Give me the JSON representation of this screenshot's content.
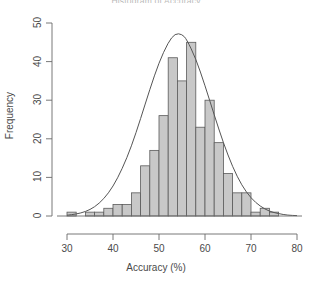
{
  "chart_data": {
    "type": "bar",
    "title": "Histogram of Accuracy",
    "xlabel": "Accuracy (%)",
    "ylabel": "Frequency",
    "xlim": [
      30,
      80
    ],
    "ylim": [
      0,
      50
    ],
    "xticks": [
      30,
      40,
      50,
      60,
      70,
      80
    ],
    "yticks": [
      0,
      10,
      20,
      30,
      40,
      50
    ],
    "grid": false,
    "legend": null,
    "bin_width": 2,
    "bar_fill_color": "#c8c8c8",
    "bar_edge_color": "#5a5a5a",
    "curve_color": "#555555",
    "curve_label": "normal density overlay",
    "bin_starts": [
      30,
      32,
      34,
      36,
      38,
      40,
      42,
      44,
      46,
      48,
      50,
      52,
      54,
      56,
      58,
      60,
      62,
      64,
      66,
      68,
      70,
      72,
      74
    ],
    "categories": [
      "30-32",
      "32-34",
      "34-36",
      "36-38",
      "38-40",
      "40-42",
      "42-44",
      "44-46",
      "46-48",
      "48-50",
      "50-52",
      "52-54",
      "54-56",
      "56-58",
      "58-60",
      "60-62",
      "62-64",
      "64-66",
      "66-68",
      "68-70",
      "70-72",
      "72-74",
      "74-76"
    ],
    "values": [
      1,
      0,
      1,
      1,
      2,
      3,
      3,
      6,
      13,
      17,
      26,
      41,
      35,
      45,
      23,
      30,
      19,
      11,
      6,
      6,
      1,
      2,
      1
    ],
    "curve_points": [
      {
        "x": 30,
        "y": 0.2
      },
      {
        "x": 32,
        "y": 0.5
      },
      {
        "x": 34,
        "y": 1.1
      },
      {
        "x": 36,
        "y": 2.3
      },
      {
        "x": 38,
        "y": 4.4
      },
      {
        "x": 40,
        "y": 7.6
      },
      {
        "x": 42,
        "y": 12.2
      },
      {
        "x": 44,
        "y": 18.0
      },
      {
        "x": 46,
        "y": 25.2
      },
      {
        "x": 48,
        "y": 32.8
      },
      {
        "x": 50,
        "y": 39.8
      },
      {
        "x": 52,
        "y": 45.0
      },
      {
        "x": 53.5,
        "y": 47.3
      },
      {
        "x": 55,
        "y": 47.1
      },
      {
        "x": 56,
        "y": 45.8
      },
      {
        "x": 58,
        "y": 40.8
      },
      {
        "x": 60,
        "y": 33.8
      },
      {
        "x": 62,
        "y": 26.2
      },
      {
        "x": 64,
        "y": 18.9
      },
      {
        "x": 66,
        "y": 12.7
      },
      {
        "x": 68,
        "y": 7.9
      },
      {
        "x": 70,
        "y": 4.6
      },
      {
        "x": 72,
        "y": 2.5
      },
      {
        "x": 74,
        "y": 1.2
      },
      {
        "x": 76,
        "y": 0.6
      },
      {
        "x": 78,
        "y": 0.2
      },
      {
        "x": 80,
        "y": 0.1
      }
    ]
  }
}
